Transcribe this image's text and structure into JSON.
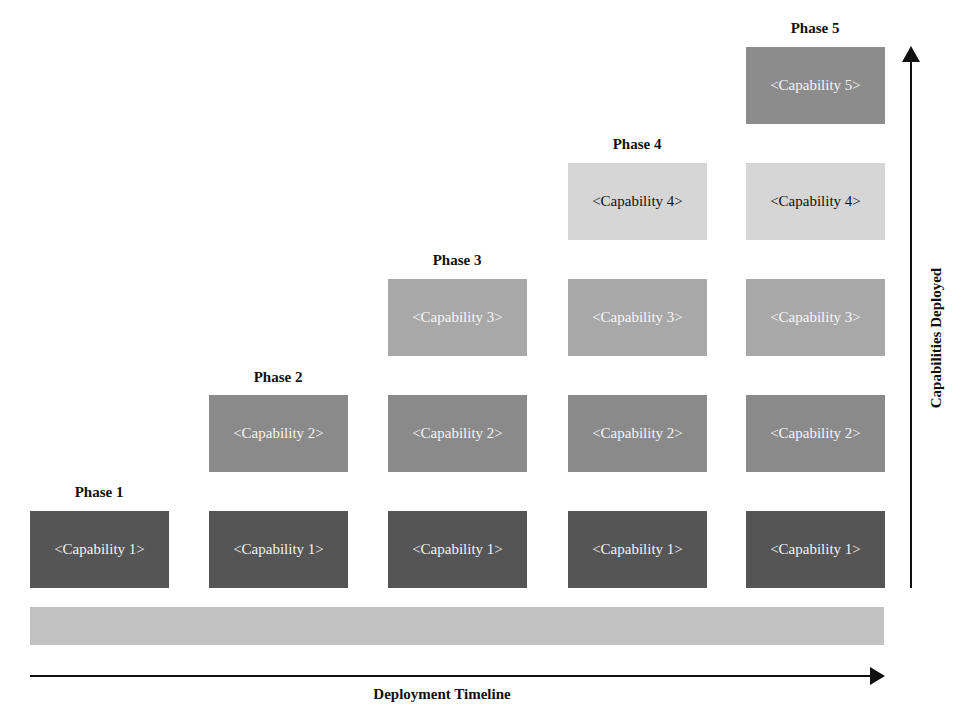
{
  "phases": [
    {
      "label": "Phase 1",
      "capabilities": [
        "<Capability 1>"
      ]
    },
    {
      "label": "Phase 2",
      "capabilities": [
        "<Capability 1>",
        "<Capability 2>"
      ]
    },
    {
      "label": "Phase 3",
      "capabilities": [
        "<Capability 1>",
        "<Capability 2>",
        "<Capability 3>"
      ]
    },
    {
      "label": "Phase 4",
      "capabilities": [
        "<Capability 1>",
        "<Capability 2>",
        "<Capability 3>",
        "<Capability 4>"
      ]
    },
    {
      "label": "Phase 5",
      "capabilities": [
        "<Capability 1>",
        "<Capability 2>",
        "<Capability 3>",
        "<Capability 4>",
        "<Capability 5>"
      ]
    }
  ],
  "axes": {
    "x_label": "Deployment Timeline",
    "y_label": "Capabilities Deployed"
  },
  "colors": {
    "capability_1": "#555555",
    "capability_2": "#8a8a8a",
    "capability_3": "#a8a8a8",
    "capability_4": "#d6d6d6",
    "capability_5": "#8c8c8c",
    "timeline_bar": "#c2c2c2",
    "axis": "#111111"
  }
}
